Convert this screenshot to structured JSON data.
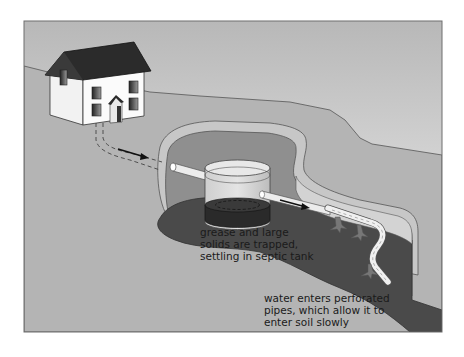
{
  "diagram": {
    "annotations": [
      {
        "id": "tank-note",
        "lines": [
          "grease and large",
          "solids are trapped,",
          "settling in septic tank"
        ]
      },
      {
        "id": "pipe-note",
        "lines": [
          "water enters perforated",
          "pipes, which allow it to",
          "enter soil slowly"
        ]
      }
    ],
    "elements": [
      "house",
      "waste-pipe",
      "flow-arrow",
      "excavation-pit",
      "septic-tank",
      "sludge-layer",
      "inlet-pipe",
      "outlet-pipe",
      "perforated-drain-pipe",
      "soil-seepage"
    ],
    "colors": {
      "sky_top": "#b9b9b9",
      "sky_bottom": "#f2f2f2",
      "ground": "#b3b3b3",
      "pit_wall": "#8f8f8f",
      "pit_floor": "#4a4a4a",
      "roof": "#2b2b2b",
      "house_wall": "#f4f4f4",
      "pipe": "#ececec",
      "frame": "#6e6e6e"
    }
  }
}
